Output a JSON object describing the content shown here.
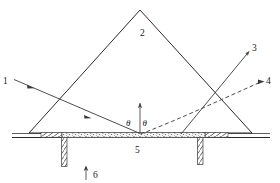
{
  "figure": {
    "background_color": "#ffffff",
    "line_color": "#2b2b2b",
    "width": 280,
    "height": 183
  },
  "labels": {
    "incident_ray": "1",
    "prism": "2",
    "reflected_ray_solid": "3",
    "reflected_ray_dashed": "4",
    "interface_layer": "5",
    "input_arrow": "6",
    "angle_left": "θ",
    "angle_right": "θ"
  },
  "geometry": {
    "prism": {
      "apex_x": 140,
      "apex_y": 10,
      "left_x": 29,
      "right_x": 252,
      "base_y": 133
    },
    "substrate_line": {
      "x1": 12,
      "x2": 270,
      "y": 137
    },
    "interface": {
      "y_top": 133,
      "y_bottom": 139,
      "stipple_x1": 62,
      "stipple_x2": 205,
      "hatch_left_x1": 41,
      "hatch_left_x2": 62,
      "hatch_right_x1": 205,
      "hatch_right_x2": 228
    },
    "left_channel": {
      "x": 62,
      "y_top": 139,
      "y_bottom": 167,
      "width": 5
    },
    "right_channel": {
      "x": 198,
      "y_top": 139,
      "y_bottom": 165,
      "width": 5
    },
    "normal_line": {
      "x": 140,
      "y_top": 103,
      "y_bottom": 134
    },
    "rays": {
      "incident_start": [
        14,
        80
      ],
      "incident_end": [
        139,
        133
      ],
      "solid_out_start": [
        181,
        134
      ],
      "solid_out_end": [
        250,
        51
      ],
      "dashed_out_start": [
        140,
        134
      ],
      "dashed_out_end": [
        264,
        81
      ]
    }
  },
  "label_positions": {
    "one": [
      4,
      83
    ],
    "two": [
      142,
      33
    ],
    "three": [
      254,
      50
    ],
    "four": [
      266,
      83
    ],
    "five": [
      137,
      150
    ],
    "six": [
      95,
      175
    ],
    "theta_left": [
      128,
      123
    ],
    "theta_right": [
      144,
      123
    ]
  }
}
